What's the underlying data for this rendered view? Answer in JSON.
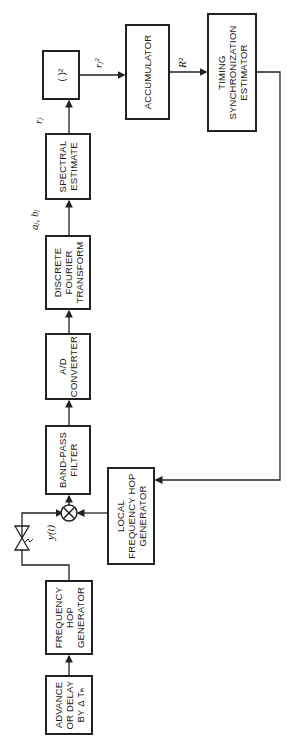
{
  "diagram": {
    "blocks": [
      {
        "id": "advance",
        "label": "ADVANCE\nOR DELAY\nBY Δ Tₕ"
      },
      {
        "id": "freq_hop_gen",
        "label": "FREQUENCY\nHOP\nGENERATOR"
      },
      {
        "id": "band_pass",
        "label": "BAND-PASS\nFILTER"
      },
      {
        "id": "local_fhg",
        "label": "LOCAL\nFREQUENCY HOP\nGENERATOR"
      },
      {
        "id": "ad",
        "label": "A/D\nCONVERTER"
      },
      {
        "id": "dft",
        "label": "DISCRETE\nFOURIER\nTRANSFORM"
      },
      {
        "id": "spectral",
        "label": "SPECTRAL\nESTIMATE"
      },
      {
        "id": "square",
        "label": "( )²"
      },
      {
        "id": "accumulator",
        "label": "ACCUMULATOR"
      },
      {
        "id": "timing",
        "label": "TIMING\nSYNCHRONIZATION\nESTIMATOR"
      }
    ],
    "signals": {
      "y": "y(t)",
      "ab": "aⱼ, bⱼ",
      "r": "rⱼ",
      "r2": "rⱼ²",
      "R2": "R²"
    }
  }
}
